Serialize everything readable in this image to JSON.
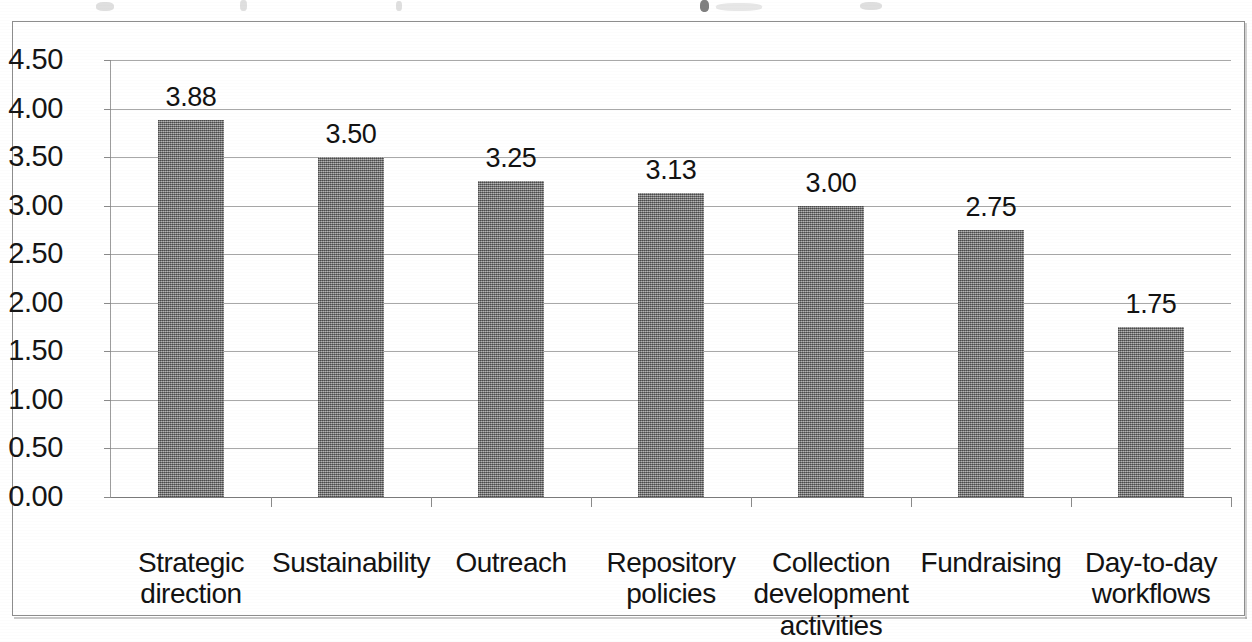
{
  "chart_data": {
    "type": "bar",
    "title": "",
    "xlabel": "",
    "ylabel": "",
    "ylim": [
      0.0,
      4.5
    ],
    "ytick_step": 0.5,
    "grid": true,
    "legend": "none",
    "bar_color": "#8a8a8a",
    "gridline_color": "#a8a8a8",
    "categories": [
      "Strategic direction",
      "Sustainability",
      "Outreach",
      "Repository policies",
      "Collection development activities",
      "Fundraising",
      "Day-to-day workflows"
    ],
    "values": [
      3.88,
      3.5,
      3.25,
      3.13,
      3.0,
      2.75,
      1.75
    ],
    "data_labels": [
      "3.88",
      "3.50",
      "3.25",
      "3.13",
      "3.00",
      "2.75",
      "1.75"
    ],
    "ytick_labels": [
      "0.00",
      "0.50",
      "1.00",
      "1.50",
      "2.00",
      "2.50",
      "3.00",
      "3.50",
      "4.00",
      "4.50"
    ],
    "ytick_values": [
      0.0,
      0.5,
      1.0,
      1.5,
      2.0,
      2.5,
      3.0,
      3.5,
      4.0,
      4.5
    ],
    "category_lines": [
      [
        "Strategic direction"
      ],
      [
        "Sustainability"
      ],
      [
        "Outreach"
      ],
      [
        "Repository",
        "policies"
      ],
      [
        "Collection",
        "development",
        "activities"
      ],
      [
        "Fundraising"
      ],
      [
        "Day-to-day",
        "workflows"
      ]
    ]
  }
}
